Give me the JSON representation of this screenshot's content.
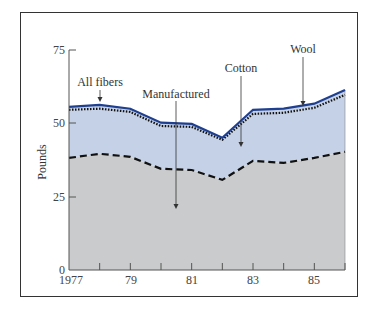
{
  "chart_data": {
    "type": "area",
    "title": "",
    "xlabel": "",
    "ylabel": "Pounds",
    "x": [
      1977,
      1978,
      1979,
      1980,
      1981,
      1982,
      1983,
      1984,
      1985,
      1986
    ],
    "x_tick_labels": [
      "1977",
      "79",
      "81",
      "83",
      "85"
    ],
    "y_tick_labels": [
      "0",
      "25",
      "50",
      "75"
    ],
    "ylim": [
      0,
      75
    ],
    "grid": false,
    "series": [
      {
        "name": "All fibers",
        "style": "solid",
        "color": "#1f3f8f",
        "values": [
          55.6,
          56.3,
          55.0,
          50.2,
          49.8,
          45.1,
          54.6,
          55.0,
          56.7,
          61.4
        ]
      },
      {
        "name": "Cotton + Manufactured (Wool boundary)",
        "style": "dotted",
        "color": "#111111",
        "values": [
          54.6,
          55.0,
          53.9,
          49.1,
          48.8,
          44.4,
          53.2,
          53.6,
          55.3,
          59.7
        ]
      },
      {
        "name": "Manufactured",
        "style": "dashed",
        "color": "#111111",
        "values": [
          38.2,
          39.6,
          38.6,
          34.5,
          34.1,
          30.7,
          37.2,
          36.5,
          38.2,
          40.3
        ]
      }
    ],
    "annotations": [
      {
        "text": "All fibers",
        "points_to_year": 1978
      },
      {
        "text": "Manufactured",
        "points_to_year": 1980.5
      },
      {
        "text": "Cotton",
        "points_to_year": 1982.6
      },
      {
        "text": "Wool",
        "points_to_year": 1984.6
      }
    ],
    "fill_colors": {
      "cotton_band": "#c5d1e6",
      "manufactured_band": "#c9cbcc"
    }
  },
  "labels": {
    "ylabel": "Pounds",
    "all_fibers": "All fibers",
    "manufactured": "Manufactured",
    "cotton": "Cotton",
    "wool": "Wool",
    "y0": "0",
    "y25": "25",
    "y50": "50",
    "y75": "75",
    "x1977": "1977",
    "x79": "79",
    "x81": "81",
    "x83": "83",
    "x85": "85"
  }
}
